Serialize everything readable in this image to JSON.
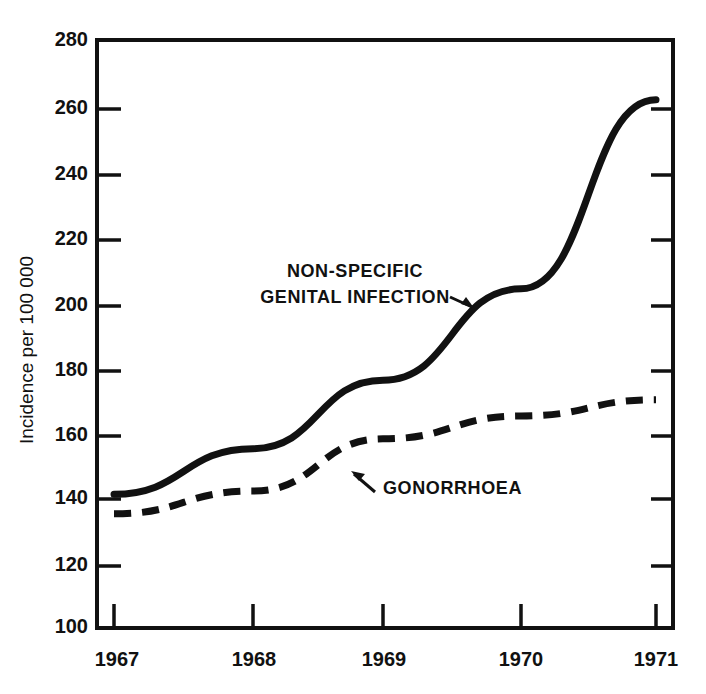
{
  "chart_data": {
    "type": "line",
    "title": "",
    "xlabel": "",
    "ylabel": "Incidence per 100 000",
    "x": [
      "1967",
      "1968",
      "1969",
      "1970",
      "1971"
    ],
    "categories": [
      "1967",
      "1968",
      "1969",
      "1970",
      "1971"
    ],
    "xlim": [
      "1967",
      "1971"
    ],
    "ylim": [
      100,
      280
    ],
    "ytick_labels": [
      "280",
      "260",
      "240",
      "220",
      "200",
      "180",
      "160",
      "140",
      "120",
      "100"
    ],
    "ytick_values": [
      280,
      260,
      240,
      220,
      200,
      180,
      160,
      140,
      120,
      100
    ],
    "ytick_step": 20,
    "grid": false,
    "legend": "inline-annotations",
    "series": [
      {
        "name": "NON-SPECIFIC GENITAL INFECTION",
        "style": "solid",
        "color": "#111111",
        "values": [
          141,
          155,
          176,
          204,
          262
        ]
      },
      {
        "name": "GONORRHOEA",
        "style": "dashed",
        "color": "#111111",
        "values": [
          135,
          142,
          158,
          165,
          170
        ]
      }
    ],
    "annotations": [
      {
        "id": "nsgi",
        "line1": "NON-SPECIFIC",
        "line2": "GENITAL INFECTION",
        "points_to_series": "NON-SPECIFIC GENITAL INFECTION"
      },
      {
        "id": "gonorrhoea",
        "line1": "GONORRHOEA",
        "points_to_series": "GONORRHOEA"
      }
    ]
  },
  "axis": {
    "y_title": "Incidence per 100 000",
    "y_ticks": [
      "280",
      "260",
      "240",
      "220",
      "200",
      "180",
      "160",
      "140",
      "120",
      "100"
    ],
    "x_ticks": [
      "1967",
      "1968",
      "1969",
      "1970",
      "1971"
    ]
  },
  "labels": {
    "nsgi_line1": "NON-SPECIFIC",
    "nsgi_line2": "GENITAL INFECTION",
    "gonorrhoea": "GONORRHOEA"
  },
  "colors": {
    "ink": "#111111",
    "background": "#ffffff"
  }
}
